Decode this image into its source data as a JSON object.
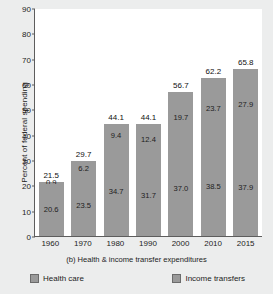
{
  "chart_data": {
    "type": "bar",
    "subtype": "stacked-vertical",
    "title": "",
    "caption": "(b) Health & income transfer expenditures",
    "xlabel": "",
    "ylabel": "Percent of federal spending",
    "categories": [
      "1960",
      "1970",
      "1980",
      "1990",
      "2000",
      "2010",
      "2015"
    ],
    "ylim": [
      0,
      90
    ],
    "yticks": [
      0,
      10,
      20,
      30,
      40,
      50,
      60,
      70,
      80,
      90
    ],
    "grid": false,
    "legend_position": "bottom",
    "series": [
      {
        "name": "Health care",
        "values": [
          0.9,
          6.2,
          9.4,
          12.4,
          19.7,
          23.7,
          27.9
        ],
        "labels": [
          "0.9",
          "6.2",
          "9.4",
          "12.4",
          "19.7",
          "23.7",
          "27.9"
        ],
        "color": "#9a9a9a"
      },
      {
        "name": "Income transfers",
        "values": [
          20.6,
          23.5,
          34.7,
          31.7,
          37.0,
          38.5,
          37.9
        ],
        "labels": [
          "20.6",
          "23.5",
          "34.7",
          "31.7",
          "37.0",
          "38.5",
          "37.9"
        ],
        "color": "#9a9a9a"
      }
    ],
    "totals": [
      21.5,
      29.7,
      44.1,
      44.1,
      56.7,
      62.2,
      65.8
    ],
    "total_labels": [
      "21.5",
      "29.7",
      "44.1",
      "44.1",
      "56.7",
      "62.2",
      "65.8"
    ]
  },
  "axis": {
    "y_tick_labels": [
      "90",
      "80",
      "70",
      "60",
      "50",
      "40",
      "30",
      "20",
      "10",
      "0"
    ],
    "y_title": "Percent of federal spending"
  },
  "legend": {
    "items": [
      {
        "label": "Health care",
        "color": "#9a9a9a"
      },
      {
        "label": "Income transfers",
        "color": "#9a9a9a"
      }
    ]
  },
  "caption": {
    "text": "(b) Health & income transfer expenditures"
  },
  "colors": {
    "bar_fill": "#9a9a9a",
    "plot_background": "#ffffff",
    "figure_background": "#eceded",
    "axis_line": "#5d5d5d",
    "text": "#1c1c1c"
  }
}
